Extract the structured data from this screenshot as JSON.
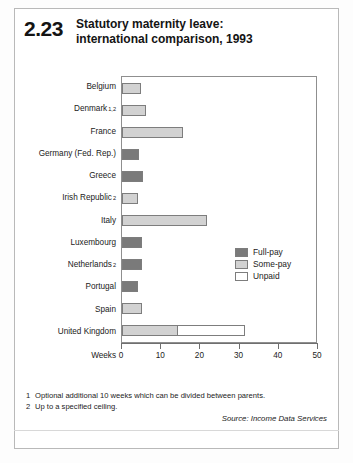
{
  "figure": {
    "number": "2.23",
    "title_line1": "Statutory maternity leave:",
    "title_line2": "international comparison, 1993"
  },
  "chart_data": {
    "type": "bar",
    "orientation": "horizontal",
    "stacked": true,
    "title": "Statutory maternity leave: international comparison, 1993",
    "xlabel": "Weeks",
    "ylabel": "",
    "xlim": [
      0,
      50
    ],
    "xticks": [
      0,
      10,
      20,
      30,
      40,
      50
    ],
    "grid": false,
    "legend_position": "inside-right",
    "categories": [
      "Belgium",
      "Denmark",
      "France",
      "Germany (Fed. Rep.)",
      "Greece",
      "Irish Republic",
      "Italy",
      "Luxembourg",
      "Netherlands",
      "Portugal",
      "Spain",
      "United Kingdom"
    ],
    "category_footnotes": [
      "",
      "1,2",
      "",
      "",
      "",
      "2",
      "",
      "",
      "2",
      "",
      "",
      ""
    ],
    "series": [
      {
        "name": "Full-pay",
        "color": "#7a7a7a",
        "values": [
          0,
          0,
          0,
          15,
          16.5,
          0,
          0,
          16,
          16,
          14.5,
          0,
          0
        ]
      },
      {
        "name": "Some-pay",
        "color": "#d2d2d2",
        "values": [
          15.5,
          17.5,
          28,
          0,
          0,
          14.5,
          33,
          0,
          0,
          0,
          16,
          18
        ]
      },
      {
        "name": "Unpaid",
        "color": "#ffffff",
        "values": [
          0,
          0,
          0,
          0,
          0,
          0,
          0,
          0,
          0,
          0,
          0,
          22
        ]
      }
    ],
    "totals": [
      15.5,
      17.5,
      28,
      15,
      16.5,
      14.5,
      33,
      16,
      16,
      14.5,
      16,
      40
    ]
  },
  "legend": [
    {
      "label": "Full-pay",
      "key": "full"
    },
    {
      "label": "Some-pay",
      "key": "some"
    },
    {
      "label": "Unpaid",
      "key": "unpaid"
    }
  ],
  "notes": [
    {
      "num": "1",
      "text": "Optional additional 10 weeks which can be divided between parents."
    },
    {
      "num": "2",
      "text": "Up to a specified ceiling."
    }
  ],
  "source": "Source: Income Data Services"
}
